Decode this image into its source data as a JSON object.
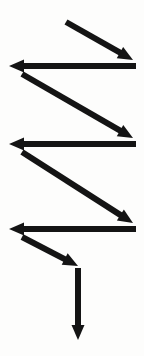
{
  "figure": {
    "width": 144,
    "height": 356,
    "background_color": "#fdfdfc",
    "stroke_color": "#141414",
    "stroke_width": 6,
    "arrowhead_length": 15,
    "arrowhead_width": 13
  },
  "arrows": [
    {
      "id": "arrow-diagonal-1",
      "name": "diagonal-down-right-1",
      "direction": "down-right",
      "kind": "diagonal",
      "x1": 66,
      "y1": 22,
      "x2": 133,
      "y2": 60
    },
    {
      "id": "arrow-horizontal-1",
      "name": "horizontal-left-1",
      "direction": "left",
      "kind": "horizontal",
      "x1": 136,
      "y1": 66,
      "x2": 9,
      "y2": 66
    },
    {
      "id": "arrow-diagonal-2",
      "name": "diagonal-down-right-2",
      "direction": "down-right",
      "kind": "diagonal",
      "x1": 22,
      "y1": 74,
      "x2": 133,
      "y2": 138
    },
    {
      "id": "arrow-horizontal-2",
      "name": "horizontal-left-2",
      "direction": "left",
      "kind": "horizontal",
      "x1": 136,
      "y1": 144,
      "x2": 9,
      "y2": 144
    },
    {
      "id": "arrow-diagonal-3",
      "name": "diagonal-down-right-3",
      "direction": "down-right",
      "kind": "diagonal",
      "x1": 22,
      "y1": 152,
      "x2": 133,
      "y2": 223
    },
    {
      "id": "arrow-horizontal-3",
      "name": "horizontal-left-3",
      "direction": "left",
      "kind": "horizontal",
      "x1": 136,
      "y1": 229,
      "x2": 9,
      "y2": 229
    },
    {
      "id": "arrow-diagonal-4",
      "name": "diagonal-down-right-4-short",
      "direction": "down-right",
      "kind": "diagonal",
      "x1": 22,
      "y1": 237,
      "x2": 78,
      "y2": 266
    },
    {
      "id": "arrow-vertical-1",
      "name": "vertical-down-1",
      "direction": "down",
      "kind": "vertical",
      "x1": 78,
      "y1": 268,
      "x2": 78,
      "y2": 340
    }
  ]
}
